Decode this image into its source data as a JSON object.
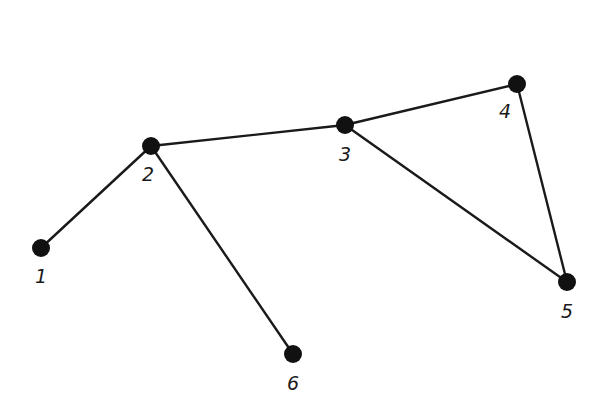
{
  "diagram": {
    "type": "undirected-graph",
    "nodes": [
      {
        "id": "1",
        "label": "1",
        "x": 41,
        "y": 248,
        "lx": 41,
        "ly": 283
      },
      {
        "id": "2",
        "label": "2",
        "x": 151,
        "y": 146,
        "lx": 148,
        "ly": 181
      },
      {
        "id": "3",
        "label": "3",
        "x": 345,
        "y": 125,
        "lx": 345,
        "ly": 161
      },
      {
        "id": "4",
        "label": "4",
        "x": 517,
        "y": 84,
        "lx": 505,
        "ly": 118
      },
      {
        "id": "5",
        "label": "5",
        "x": 567,
        "y": 282,
        "lx": 567,
        "ly": 318
      },
      {
        "id": "6",
        "label": "6",
        "x": 293,
        "y": 354,
        "lx": 293,
        "ly": 390
      }
    ],
    "edges": [
      {
        "from": "1",
        "to": "2"
      },
      {
        "from": "2",
        "to": "3"
      },
      {
        "from": "2",
        "to": "6"
      },
      {
        "from": "3",
        "to": "4"
      },
      {
        "from": "3",
        "to": "5"
      },
      {
        "from": "4",
        "to": "5"
      }
    ],
    "colors": {
      "node": "#111111",
      "edge": "#1a1a1a",
      "background": "#ffffff"
    }
  }
}
